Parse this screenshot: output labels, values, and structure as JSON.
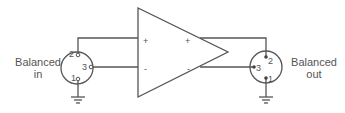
{
  "diagram": {
    "input_label_line1": "Balanced",
    "input_label_line2": "in",
    "output_label_line1": "Balanced",
    "output_label_line2": "out",
    "input_pins": {
      "pin2": "2",
      "pin3": "3",
      "pin1": "1"
    },
    "output_pins": {
      "pin2": "2",
      "pin3": "3",
      "pin1": "1"
    },
    "amp_input_plus": "+",
    "amp_input_minus": "-",
    "amp_output_plus": "+",
    "amp_output_minus": "-",
    "colors": {
      "line": "#555555",
      "text": "#555555",
      "background": "#ffffff"
    }
  }
}
